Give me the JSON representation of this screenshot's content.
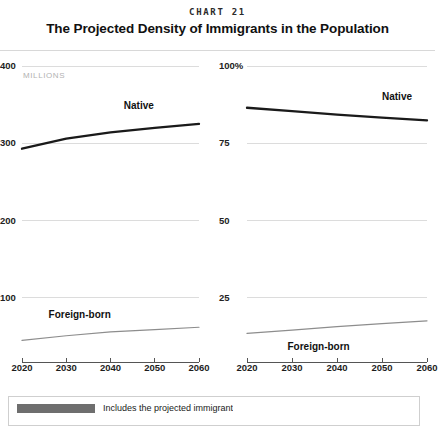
{
  "header": {
    "kicker": "CHART 21",
    "title": "The Projected Density of Immigrants in the Population"
  },
  "legend": {
    "swatch_color": "#6e6e6e",
    "text": "Includes the projected immigrant"
  },
  "chart_data": [
    {
      "type": "line",
      "panel": "left",
      "title": "",
      "xlabel": "",
      "ylabel": "MILLIONS",
      "units_label": "MILLIONS",
      "x": [
        2020,
        2030,
        2040,
        2050,
        2060
      ],
      "xticklabels": [
        "2020",
        "2030",
        "2040",
        "2050",
        "2060"
      ],
      "xlim": [
        2020,
        2060
      ],
      "ylim": [
        0,
        400
      ],
      "yticks": [
        100,
        200,
        300,
        400
      ],
      "yticklabels": [
        "100",
        "200",
        "300",
        "400"
      ],
      "grid": true,
      "legend_position": "inline-labels",
      "series": [
        {
          "name": "Native",
          "color": "#1a1a1a",
          "width": 2.3,
          "values": [
            293,
            306,
            314,
            320,
            325
          ],
          "label_x": 2043,
          "label_y": 348
        },
        {
          "name": "Foreign-born",
          "color": "#8d8d8d",
          "width": 1.2,
          "values": [
            45,
            51,
            56,
            59,
            62
          ],
          "label_x": 2026,
          "label_y": 78
        }
      ]
    },
    {
      "type": "line",
      "panel": "right",
      "title": "",
      "xlabel": "",
      "ylabel": "",
      "units_label": "",
      "x": [
        2020,
        2030,
        2040,
        2050,
        2060
      ],
      "xticklabels": [
        "2020",
        "2030",
        "2040",
        "2050",
        "2060"
      ],
      "xlim": [
        2020,
        2060
      ],
      "ylim": [
        0,
        100
      ],
      "yticks": [
        25,
        50,
        75,
        100
      ],
      "yticklabels": [
        "25",
        "50",
        "75",
        "100%"
      ],
      "grid": true,
      "legend_position": "inline-labels",
      "series": [
        {
          "name": "Native",
          "color": "#1a1a1a",
          "width": 2.3,
          "values": [
            86.5,
            85.4,
            84.3,
            83.3,
            82.4
          ],
          "label_x": 2050,
          "label_y": 90
        },
        {
          "name": "Foreign-born",
          "color": "#8d8d8d",
          "width": 1.2,
          "values": [
            13.5,
            14.6,
            15.7,
            16.7,
            17.6
          ],
          "label_x": 2029,
          "label_y": 9
        }
      ]
    }
  ]
}
